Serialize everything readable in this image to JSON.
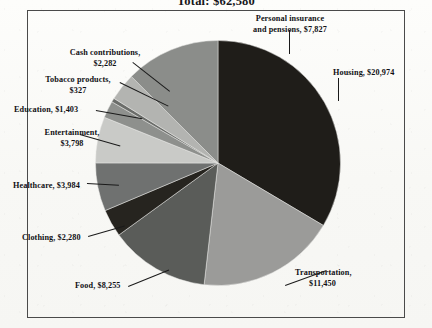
{
  "chart_data": {
    "type": "pie",
    "title": "Total: $62,580",
    "currency": "$",
    "total": 62580,
    "categories": [
      "Housing",
      "Transportation",
      "Food",
      "Clothing",
      "Healthcare",
      "Entertainment",
      "Education",
      "Tobacco products",
      "Cash contributions",
      "Personal insurance and pensions"
    ],
    "values": [
      20974,
      11450,
      8255,
      2280,
      3984,
      3798,
      1403,
      327,
      2282,
      7827
    ],
    "labels": [
      "Housing, $20,974",
      "Transportation, $11,450",
      "Food, $8,255",
      "Clothing, $2,280",
      "Healthcare, $3,984",
      "Entertainment, $3,798",
      "Education, $1,403",
      "Tobacco products, $327",
      "Cash contributions, $2,282",
      "Personal insurance and pensions, $7,827"
    ],
    "slice_colors": [
      "#1f1d19",
      "#9b9b99",
      "#5a5c59",
      "#26241f",
      "#6f7170",
      "#c9cac7",
      "#8e908d",
      "#6b6d6a",
      "#b3b4b1",
      "#8b8d8a"
    ],
    "legend": "none",
    "grid": false,
    "start_angle_deg": 0,
    "direction": "clockwise"
  },
  "labels": {
    "housing": "Housing, $20,974",
    "transportation_line1": "Transportation,",
    "transportation_line2": "$11,450",
    "food": "Food, $8,255",
    "clothing": "Clothing, $2,280",
    "healthcare": "Healthcare, $3,984",
    "entertainment_line1": "Entertainment,",
    "entertainment_line2": "$3,798",
    "education": "Education, $1,403",
    "tobacco_line1": "Tobacco products,",
    "tobacco_line2": "$327",
    "cash_line1": "Cash contributions,",
    "cash_line2": "$2,282",
    "personal_line1": "Personal insurance",
    "personal_line2": "and pensions, $7,827"
  }
}
